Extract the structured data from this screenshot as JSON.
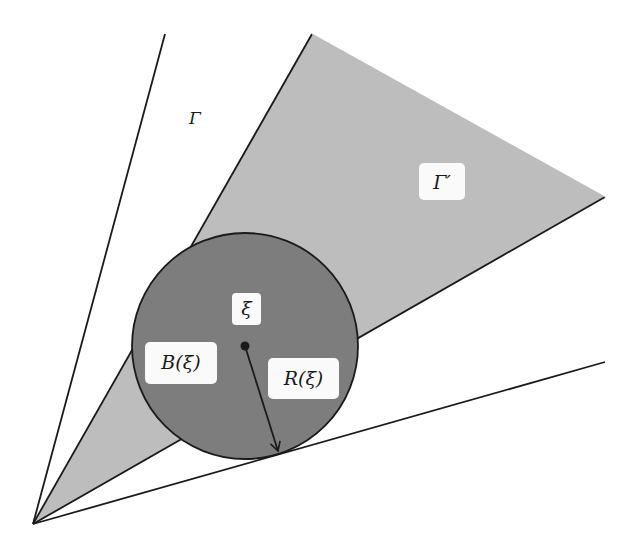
{
  "diagram": {
    "type": "cone-geometry",
    "labels": {
      "outer_cone": "Γ",
      "inner_cone": "Γ′",
      "point": "ξ",
      "ball": "B(ξ)",
      "radius": "R(ξ)"
    },
    "colors": {
      "background": "#ffffff",
      "inner_cone_fill": "#bdbdbd",
      "ball_fill": "#7d7d7d",
      "stroke": "#1a1a1a",
      "label_box": "#fafafa"
    },
    "geometry": {
      "apex": [
        33,
        524
      ],
      "outer_cone_left_end": [
        165,
        34
      ],
      "outer_cone_right_end": [
        605,
        362
      ],
      "inner_cone_top": [
        312,
        34
      ],
      "inner_cone_tip": [
        605,
        197
      ],
      "ball_center": [
        245,
        346
      ],
      "ball_radius": 113,
      "radius_arrow_end": [
        278,
        452
      ]
    }
  }
}
